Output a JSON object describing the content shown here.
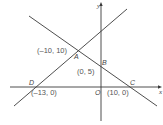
{
  "diagram": {
    "type": "coordinate-geometry",
    "axes": {
      "x_label": "x",
      "y_label": "y",
      "origin_label": "O"
    },
    "lines": [
      {
        "name": "line-DA",
        "through": [
          "D",
          "A"
        ]
      },
      {
        "name": "line-ABC",
        "through": [
          "A",
          "B",
          "C"
        ]
      }
    ],
    "points": {
      "A": {
        "label": "A",
        "coord_label": "(–10, 10)"
      },
      "B": {
        "label": "B",
        "coord_label": "(0, 5)"
      },
      "C": {
        "label": "C",
        "coord_label": "(10, 0)"
      },
      "D": {
        "label": "D",
        "coord_label": "(–13, 0)"
      },
      "O": {
        "label": "O"
      }
    },
    "colors": {
      "line": "#3a3a3a",
      "text": "#555555",
      "background": "#ffffff"
    }
  }
}
